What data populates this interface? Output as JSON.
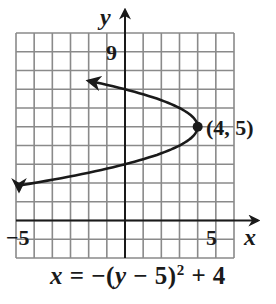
{
  "chart_data": {
    "type": "line",
    "title": "",
    "equation": "x = -(y - 5)^2 + 4",
    "xlabel": "x",
    "ylabel": "y",
    "xlim": [
      -6,
      6
    ],
    "ylim": [
      -2,
      10
    ],
    "grid": true,
    "x_tick_labels": [
      {
        "value": -5,
        "label": "-5"
      },
      {
        "value": 5,
        "label": "5"
      }
    ],
    "y_tick_labels": [
      {
        "value": 9,
        "label": "9"
      }
    ],
    "series": [
      {
        "name": "x = -(y - 5)^2 + 4",
        "shape": "parabola opening left",
        "points": [
          {
            "x": -5.8,
            "y": 7.4
          },
          {
            "x": -5,
            "y": 8
          },
          {
            "x": 0,
            "y": 7
          },
          {
            "x": 3,
            "y": 6
          },
          {
            "x": 4,
            "y": 5
          },
          {
            "x": 3,
            "y": 4
          },
          {
            "x": 0,
            "y": 3
          },
          {
            "x": -5,
            "y": 2
          },
          {
            "x": -5.8,
            "y": 1.6
          }
        ]
      }
    ],
    "annotations": [
      {
        "type": "point",
        "x": 4,
        "y": 5,
        "label": "(4, 5)"
      }
    ]
  },
  "labels": {
    "y_axis": "y",
    "x_axis": "x",
    "tick_y9": "9",
    "tick_xneg5": "−5",
    "tick_x5": "5",
    "vertex": "(4, 5)"
  },
  "equation": {
    "lhs": "x",
    "eq": " = −(",
    "var": "y",
    "mid": " − 5)",
    "exp": "2",
    "rhs": " + 4"
  }
}
